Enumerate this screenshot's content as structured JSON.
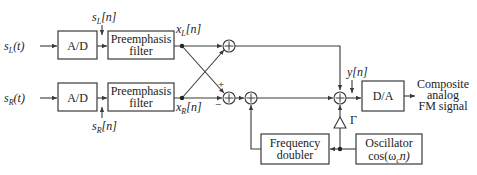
{
  "diagram": {
    "inputs": {
      "left": {
        "base": "s",
        "sub": "L",
        "arg": "(t)"
      },
      "right": {
        "base": "s",
        "sub": "R",
        "arg": "(t)"
      }
    },
    "blocks": {
      "ad_top": "A/D",
      "ad_bottom": "A/D",
      "filter_top_line1": "Preemphasis",
      "filter_top_line2": "filter",
      "filter_bottom_line1": "Preemphasis",
      "filter_bottom_line2": "filter",
      "da": "D/A",
      "freq_doubler_line1": "Frequency",
      "freq_doubler_line2": "doubler",
      "oscillator_line1": "Oscillator",
      "oscillator_line2_pre": "cos(ω",
      "oscillator_line2_sub": "c",
      "oscillator_line2_post": "n)"
    },
    "signals": {
      "sL_n": {
        "base": "s",
        "sub": "L",
        "arg": "[n]"
      },
      "sR_n": {
        "base": "s",
        "sub": "R",
        "arg": "[n]"
      },
      "xL_n": {
        "base": "x",
        "sub": "L",
        "arg": "[n]"
      },
      "xR_n": {
        "base": "x",
        "sub": "R",
        "arg": "[n]"
      },
      "y_n": "y[n]",
      "gain": "Γ"
    },
    "summer_symbol": "+",
    "signs": {
      "plus": "+",
      "minus": "−"
    },
    "output": {
      "line1": "Composite",
      "line2": "analog",
      "line3": "FM signal"
    }
  }
}
